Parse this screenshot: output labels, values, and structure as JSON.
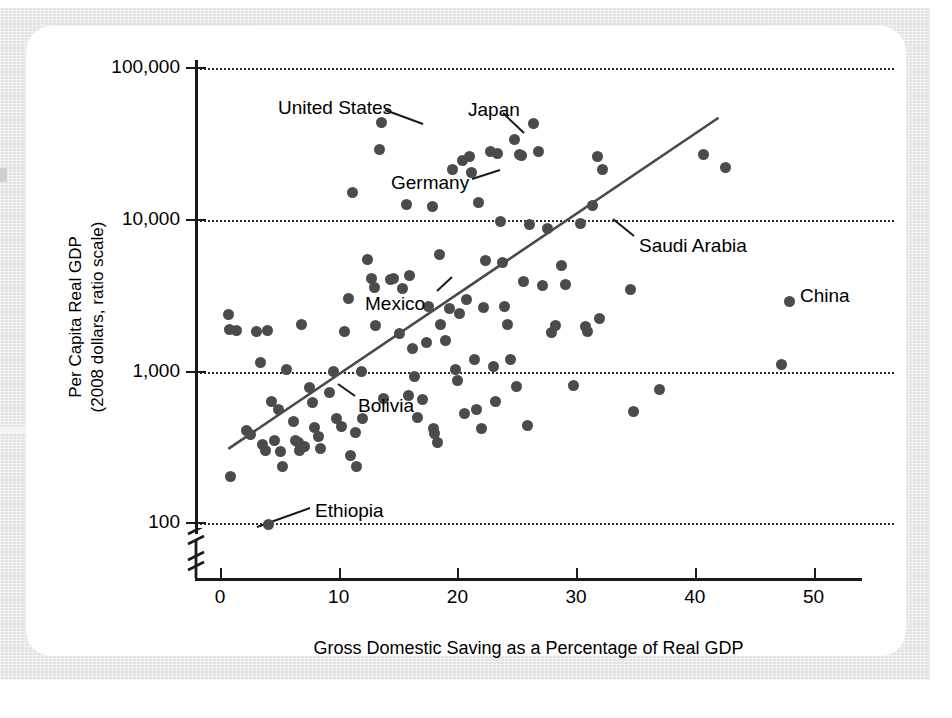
{
  "figure": {
    "background_color": "#e3e3e3",
    "card_color": "#ffffff",
    "point_color": "#4b4b4b",
    "line_color": "#4a4a4a"
  },
  "chart_data": {
    "type": "scatter",
    "title": "",
    "xlabel": "Gross Domestic Saving as a Percentage of Real GDP",
    "ylabel": "Per Capita Real GDP\n(2008 dollars, ratio scale)",
    "ylabel_line1": "Per Capita Real GDP",
    "ylabel_line2": "(2008 dollars, ratio scale)",
    "yscale": "log",
    "xlim": [
      0,
      56
    ],
    "ylim": [
      100,
      100000
    ],
    "grid": "horizontal-dotted",
    "legend": "none",
    "xticks": [
      0,
      10,
      20,
      30,
      40,
      50
    ],
    "xticklabels": [
      "0",
      "10",
      "20",
      "30",
      "40",
      "50"
    ],
    "yticks": [
      100,
      1000,
      10000,
      100000
    ],
    "yticklabels": [
      "100",
      "1,000",
      "10,000",
      "100,000"
    ],
    "axis_break": "y-axis broken below 100",
    "trendline": {
      "label": "regression line",
      "x_start": 0.7,
      "y_start": 310,
      "x_end": 42.0,
      "y_end": 47000
    },
    "points": [
      {
        "x": 0.7,
        "y": 2380
      },
      {
        "x": 0.8,
        "y": 1900
      },
      {
        "x": 0.9,
        "y": 205
      },
      {
        "x": 1.4,
        "y": 1870
      },
      {
        "x": 2.2,
        "y": 410
      },
      {
        "x": 2.6,
        "y": 385
      },
      {
        "x": 3.1,
        "y": 1850
      },
      {
        "x": 3.4,
        "y": 1140
      },
      {
        "x": 3.6,
        "y": 330
      },
      {
        "x": 3.8,
        "y": 300
      },
      {
        "x": 4.0,
        "y": 1870
      },
      {
        "x": 4.1,
        "y": 99,
        "label": "Ethiopia"
      },
      {
        "x": 4.3,
        "y": 640
      },
      {
        "x": 4.6,
        "y": 350
      },
      {
        "x": 4.9,
        "y": 560
      },
      {
        "x": 5.1,
        "y": 298
      },
      {
        "x": 5.3,
        "y": 238
      },
      {
        "x": 5.6,
        "y": 1030
      },
      {
        "x": 6.2,
        "y": 470
      },
      {
        "x": 6.4,
        "y": 350
      },
      {
        "x": 6.6,
        "y": 340
      },
      {
        "x": 6.7,
        "y": 300
      },
      {
        "x": 6.9,
        "y": 2050
      },
      {
        "x": 7.1,
        "y": 320
      },
      {
        "x": 7.5,
        "y": 790
      },
      {
        "x": 7.8,
        "y": 630
      },
      {
        "x": 8.0,
        "y": 430
      },
      {
        "x": 8.3,
        "y": 375
      },
      {
        "x": 8.5,
        "y": 310
      },
      {
        "x": 9.2,
        "y": 730
      },
      {
        "x": 9.6,
        "y": 1000,
        "label": "Bolivia"
      },
      {
        "x": 9.8,
        "y": 490
      },
      {
        "x": 10.2,
        "y": 435
      },
      {
        "x": 10.5,
        "y": 1840
      },
      {
        "x": 10.8,
        "y": 3010
      },
      {
        "x": 11.0,
        "y": 280
      },
      {
        "x": 11.2,
        "y": 15200
      },
      {
        "x": 11.4,
        "y": 400
      },
      {
        "x": 11.5,
        "y": 237
      },
      {
        "x": 11.9,
        "y": 1000
      },
      {
        "x": 12.0,
        "y": 490
      },
      {
        "x": 12.4,
        "y": 5500
      },
      {
        "x": 12.8,
        "y": 4100
      },
      {
        "x": 13.0,
        "y": 3600
      },
      {
        "x": 13.1,
        "y": 2000
      },
      {
        "x": 13.4,
        "y": 29000
      },
      {
        "x": 13.6,
        "y": 44000,
        "label": "United States"
      },
      {
        "x": 13.8,
        "y": 665
      },
      {
        "x": 14.4,
        "y": 4050
      },
      {
        "x": 14.6,
        "y": 4100
      },
      {
        "x": 15.1,
        "y": 1780
      },
      {
        "x": 15.4,
        "y": 3550
      },
      {
        "x": 15.7,
        "y": 12600
      },
      {
        "x": 15.9,
        "y": 700
      },
      {
        "x": 16.0,
        "y": 4300
      },
      {
        "x": 16.2,
        "y": 1420
      },
      {
        "x": 16.4,
        "y": 930
      },
      {
        "x": 16.6,
        "y": 495
      },
      {
        "x": 17.1,
        "y": 650
      },
      {
        "x": 17.4,
        "y": 1550
      },
      {
        "x": 17.6,
        "y": 2700
      },
      {
        "x": 17.9,
        "y": 12200
      },
      {
        "x": 18.0,
        "y": 420
      },
      {
        "x": 18.1,
        "y": 390
      },
      {
        "x": 18.3,
        "y": 340
      },
      {
        "x": 18.5,
        "y": 5900
      },
      {
        "x": 18.6,
        "y": 2050
      },
      {
        "x": 19.0,
        "y": 1600
      },
      {
        "x": 19.3,
        "y": 2600
      },
      {
        "x": 19.6,
        "y": 21500
      },
      {
        "x": 19.8,
        "y": 1030
      },
      {
        "x": 20.0,
        "y": 870
      },
      {
        "x": 20.2,
        "y": 2400
      },
      {
        "x": 20.4,
        "y": 24500
      },
      {
        "x": 20.6,
        "y": 530
      },
      {
        "x": 20.8,
        "y": 3000
      },
      {
        "x": 21.0,
        "y": 26000
      },
      {
        "x": 21.2,
        "y": 20500,
        "label": "Germany"
      },
      {
        "x": 21.4,
        "y": 1200
      },
      {
        "x": 21.6,
        "y": 560
      },
      {
        "x": 21.8,
        "y": 13000
      },
      {
        "x": 22.0,
        "y": 420
      },
      {
        "x": 22.2,
        "y": 2650
      },
      {
        "x": 22.4,
        "y": 5400
      },
      {
        "x": 22.8,
        "y": 28000
      },
      {
        "x": 23.0,
        "y": 1080
      },
      {
        "x": 23.2,
        "y": 640
      },
      {
        "x": 23.4,
        "y": 27500
      },
      {
        "x": 23.6,
        "y": 9800
      },
      {
        "x": 23.8,
        "y": 5200
      },
      {
        "x": 24.0,
        "y": 2700
      },
      {
        "x": 24.2,
        "y": 2050
      },
      {
        "x": 24.5,
        "y": 1200
      },
      {
        "x": 24.8,
        "y": 34000,
        "label": "Japan"
      },
      {
        "x": 25.0,
        "y": 800
      },
      {
        "x": 25.2,
        "y": 27000
      },
      {
        "x": 25.4,
        "y": 26500
      },
      {
        "x": 25.6,
        "y": 3900
      },
      {
        "x": 25.9,
        "y": 440
      },
      {
        "x": 26.1,
        "y": 9300
      },
      {
        "x": 26.4,
        "y": 43000
      },
      {
        "x": 26.8,
        "y": 28000
      },
      {
        "x": 27.2,
        "y": 3700
      },
      {
        "x": 27.6,
        "y": 8700
      },
      {
        "x": 27.9,
        "y": 1800
      },
      {
        "x": 28.3,
        "y": 2000
      },
      {
        "x": 28.8,
        "y": 5000
      },
      {
        "x": 29.1,
        "y": 3750
      },
      {
        "x": 29.8,
        "y": 810
      },
      {
        "x": 30.4,
        "y": 9500,
        "label": "Saudi Arabia"
      },
      {
        "x": 30.8,
        "y": 1980
      },
      {
        "x": 31.0,
        "y": 1850
      },
      {
        "x": 31.4,
        "y": 12500
      },
      {
        "x": 31.8,
        "y": 26000
      },
      {
        "x": 32.0,
        "y": 2250
      },
      {
        "x": 32.2,
        "y": 21500
      },
      {
        "x": 34.6,
        "y": 3450
      },
      {
        "x": 34.8,
        "y": 550
      },
      {
        "x": 37.0,
        "y": 760
      },
      {
        "x": 40.7,
        "y": 27000
      },
      {
        "x": 42.6,
        "y": 22000
      },
      {
        "x": 47.3,
        "y": 1120
      },
      {
        "x": 48.0,
        "y": 2880,
        "label": "China"
      }
    ],
    "annotations": [
      {
        "label": "United States",
        "text_x": 278,
        "text_y": 97,
        "anchor": "left",
        "leader": [
          [
            385,
            110
          ],
          [
            423,
            124
          ]
        ]
      },
      {
        "label": "Japan",
        "text_x": 468,
        "text_y": 99,
        "anchor": "left",
        "leader": [
          [
            503,
            113
          ],
          [
            524,
            133
          ]
        ]
      },
      {
        "label": "Germany",
        "text_x": 391,
        "text_y": 172,
        "anchor": "left",
        "leader": [
          [
            472,
            179
          ],
          [
            500,
            170
          ]
        ]
      },
      {
        "label": "Saudi Arabia",
        "text_x": 639,
        "text_y": 235,
        "anchor": "left",
        "leader": [
          [
            634,
            236
          ],
          [
            613,
            219
          ]
        ]
      },
      {
        "label": "China",
        "text_x": 800,
        "text_y": 285,
        "anchor": "left",
        "leader": []
      },
      {
        "label": "Mexico",
        "text_x": 365,
        "text_y": 293,
        "anchor": "left",
        "leader": [
          [
            437,
            291
          ],
          [
            452,
            277
          ]
        ]
      },
      {
        "label": "Bolivia",
        "text_x": 358,
        "text_y": 395,
        "anchor": "left",
        "leader": [
          [
            355,
            396
          ],
          [
            338,
            384
          ]
        ]
      },
      {
        "label": "Ethiopia",
        "text_x": 315,
        "text_y": 500,
        "anchor": "left",
        "leader": [
          [
            310,
            508
          ],
          [
            257,
            527
          ]
        ]
      }
    ]
  }
}
